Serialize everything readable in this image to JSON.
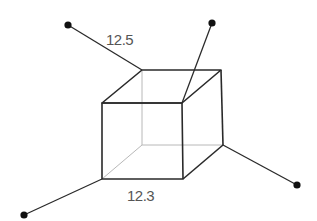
{
  "diagram": {
    "type": "cube-with-connectors",
    "colors": {
      "edge": "#2a2a2a",
      "hidden_edge": "#b8b8b8",
      "connector": "#2a2a2a",
      "dot": "#111111",
      "label": "#555555",
      "background": "#ffffff"
    },
    "labels": {
      "top_left_connector": "12.5",
      "bottom_edge": "12.3"
    },
    "cube": {
      "vertices": {
        "front_top_left": [
          102,
          103
        ],
        "front_top_right": [
          182,
          103
        ],
        "front_bottom_left": [
          102,
          179
        ],
        "front_bottom_right": [
          183,
          179
        ],
        "back_top_left": [
          142,
          70
        ],
        "back_top_right": [
          221,
          70
        ],
        "back_bottom_left": [
          142,
          145
        ],
        "back_bottom_right": [
          223,
          145
        ]
      }
    },
    "connectors": [
      {
        "name": "top-left",
        "from": "back_top_left",
        "to": [
          68,
          25
        ]
      },
      {
        "name": "top-right",
        "from": "front_top_right",
        "to": [
          212,
          23
        ]
      },
      {
        "name": "right",
        "from": "back_bottom_right",
        "to": [
          297,
          185
        ]
      },
      {
        "name": "bottom-left",
        "from": "front_bottom_left",
        "to": [
          24,
          215
        ]
      }
    ]
  }
}
